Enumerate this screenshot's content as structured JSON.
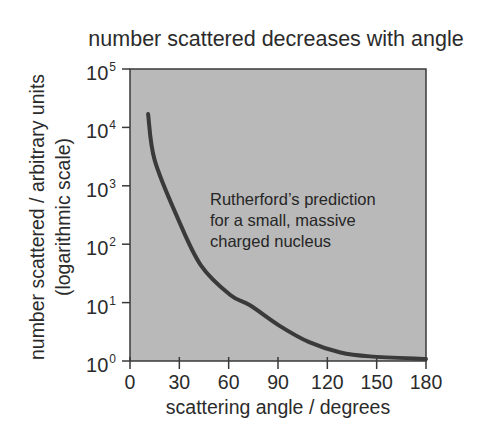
{
  "chart_data": {
    "type": "line",
    "title": "number scattered decreases with angle",
    "xlabel": "scattering angle / degrees",
    "ylabel": "number scattered / arbitrary units",
    "ylabel_sub": "(logarithmic scale)",
    "xlim": [
      0,
      180
    ],
    "ylim": [
      1,
      100000
    ],
    "yscale": "log",
    "grid": false,
    "legend": null,
    "x_ticks": [
      "0",
      "30",
      "60",
      "90",
      "120",
      "150",
      "180"
    ],
    "y_ticks": [
      {
        "base": "10",
        "exp": "0"
      },
      {
        "base": "10",
        "exp": "1"
      },
      {
        "base": "10",
        "exp": "2"
      },
      {
        "base": "10",
        "exp": "3"
      },
      {
        "base": "10",
        "exp": "4"
      },
      {
        "base": "10",
        "exp": "5"
      }
    ],
    "series": [
      {
        "name": "Rutherford's prediction for a small, massive charged nucleus",
        "x": [
          11,
          15,
          29,
          43,
          61,
          73,
          91,
          109,
          128,
          146,
          180
        ],
        "values": [
          17000,
          2750,
          280,
          44,
          13.5,
          9,
          4,
          2.1,
          1.4,
          1.2,
          1.0
        ]
      }
    ],
    "annotation": {
      "lines": [
        "Rutherford’s prediction",
        "for a small, massive",
        "charged nucleus"
      ]
    },
    "colors": {
      "plot_background": "#b9b9b9",
      "curve": "#3a3a3a",
      "axis": "#3a3a3a"
    }
  }
}
